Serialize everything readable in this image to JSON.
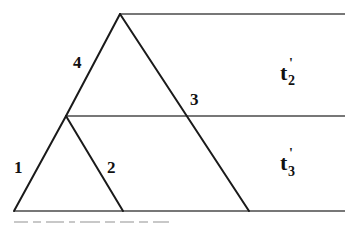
{
  "diagram": {
    "type": "phylogenetic-tree",
    "branch_labels": {
      "b1": "1",
      "b2": "2",
      "b3": "3",
      "b4": "4"
    },
    "interval_labels": {
      "t2": {
        "base": "t",
        "prime": "'",
        "sub": "2"
      },
      "t3": {
        "base": "t",
        "prime": "'",
        "sub": "3"
      }
    },
    "colors": {
      "edge": "#1a1a1a",
      "time_line": "#4a4a4a",
      "background": "#ffffff"
    }
  }
}
